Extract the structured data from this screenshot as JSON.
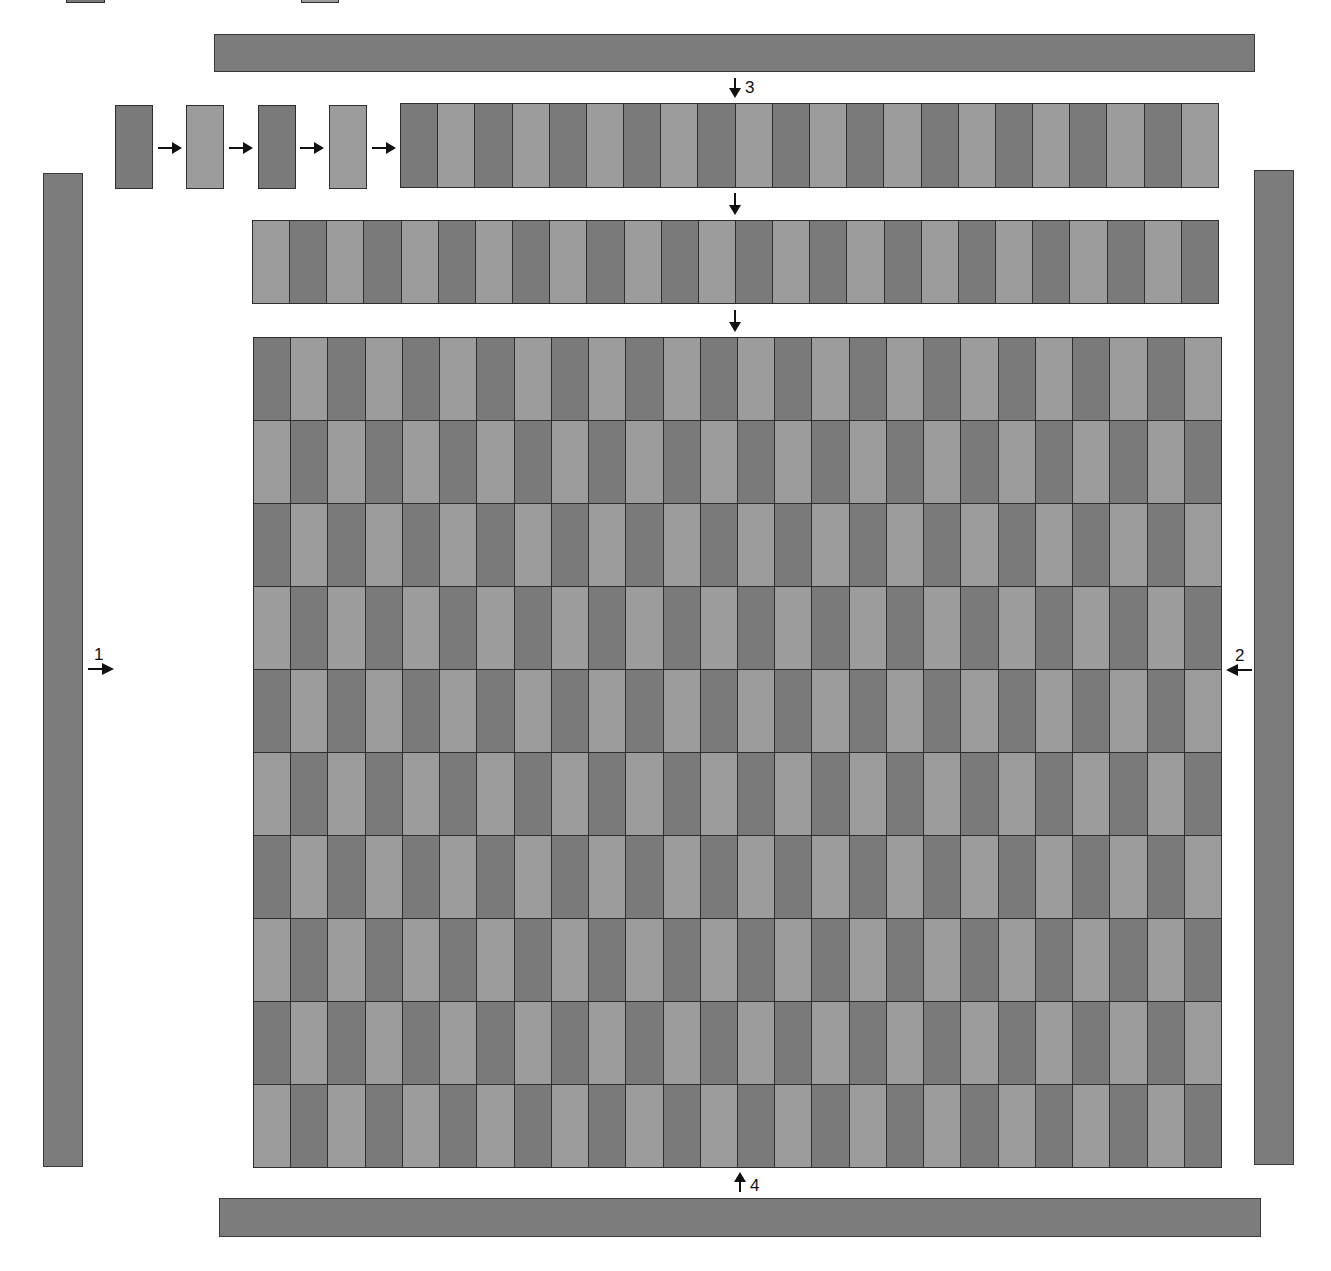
{
  "diagram": {
    "type": "strip-weaving-assembly",
    "colors": {
      "dark": "#7a7a7a",
      "light": "#9c9c9c",
      "border": "#2e2e2e",
      "bar": "#7c7c7c",
      "arrow": "#111111"
    },
    "partial_top_boxes": [
      {
        "shade": "dark",
        "x": 66,
        "y": -40,
        "w": 39,
        "h": 43
      },
      {
        "shade": "light",
        "x": 301,
        "y": -40,
        "w": 38,
        "h": 43
      }
    ],
    "bars": [
      {
        "name": "top-bar",
        "x": 214,
        "y": 34,
        "w": 1041,
        "h": 38
      },
      {
        "name": "bottom-bar",
        "x": 219,
        "y": 1198,
        "w": 1042,
        "h": 39
      },
      {
        "name": "left-bar",
        "x": 43,
        "y": 173,
        "w": 40,
        "h": 994
      },
      {
        "name": "right-bar",
        "x": 1254,
        "y": 170,
        "w": 40,
        "h": 995
      }
    ],
    "single_strips": [
      {
        "shade": "dark",
        "x": 115,
        "y": 105,
        "w": 38,
        "h": 84
      },
      {
        "shade": "light",
        "x": 186,
        "y": 105,
        "w": 38,
        "h": 84
      },
      {
        "shade": "dark",
        "x": 258,
        "y": 105,
        "w": 38,
        "h": 84
      },
      {
        "shade": "light",
        "x": 329,
        "y": 105,
        "w": 38,
        "h": 84
      }
    ],
    "horizontal_arrows": [
      {
        "x": 158,
        "y": 148,
        "w": 24
      },
      {
        "x": 229,
        "y": 148,
        "w": 24
      },
      {
        "x": 300,
        "y": 148,
        "w": 24
      },
      {
        "x": 372,
        "y": 148,
        "w": 24
      }
    ],
    "row1": {
      "x": 400,
      "y": 103,
      "w": 818,
      "h": 85,
      "cells": 22,
      "start_shade": "dark"
    },
    "row2": {
      "x": 252,
      "y": 220,
      "w": 966,
      "h": 84,
      "cells": 26,
      "start_shade": "light"
    },
    "grid": {
      "x": 253,
      "y": 337,
      "w": 968,
      "h": 830,
      "rows": 10,
      "cols": 26,
      "start_shade": "dark"
    },
    "down_arrows": [
      {
        "x": 735,
        "y": 78,
        "h": 20
      },
      {
        "x": 735,
        "y": 193,
        "h": 22
      },
      {
        "x": 735,
        "y": 310,
        "h": 22
      }
    ],
    "up_arrow": {
      "x": 740,
      "y": 1172,
      "h": 20
    },
    "labels": {
      "arrow1": "1",
      "arrow2": "2",
      "arrow3": "3",
      "arrow4": "4"
    }
  }
}
